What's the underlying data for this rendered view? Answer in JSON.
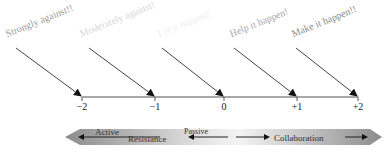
{
  "scale": {
    "labels": [
      {
        "text": "Strongly against!!",
        "value": "−2",
        "color": "#9a9a9a"
      },
      {
        "text": "Moderately against!",
        "value": "−1",
        "color": "#d6d6d6"
      },
      {
        "text": "Let it happen!",
        "value": "0",
        "color": "#efefef"
      },
      {
        "text": "Help it happen!",
        "value": "+1",
        "color": "#a8a8a8"
      },
      {
        "text": "Make it happen!!",
        "value": "+2",
        "color": "#8a8a8a"
      }
    ]
  },
  "bar": {
    "active": "Active",
    "resistance": "Resistance",
    "passive": "Passive",
    "collaboration": "Collaboration"
  }
}
